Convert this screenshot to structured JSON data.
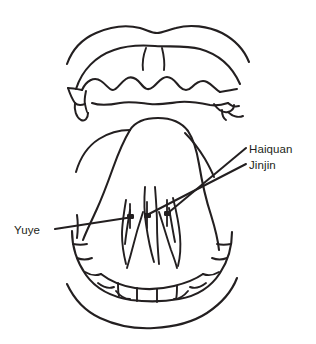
{
  "figure": {
    "background_color": "#ffffff",
    "ink_color": "#231f20",
    "width": 316,
    "height": 344
  },
  "labels": {
    "haiquan": "Haiquan",
    "jinjin": "Jinjin",
    "yuye": "Yuye"
  },
  "annotations": [
    {
      "name": "haiquan",
      "text": "Haiquan",
      "text_x": 249,
      "text_y": 142,
      "leader_from": [
        246,
        148
      ],
      "leader_to": [
        168,
        213
      ],
      "point": [
        168,
        213
      ]
    },
    {
      "name": "jinjin",
      "text": "Jinjin",
      "text_x": 249,
      "text_y": 158,
      "leader_from": [
        246,
        164
      ],
      "leader_to": [
        147,
        215
      ],
      "point": [
        147,
        215
      ]
    },
    {
      "name": "yuye",
      "text": "Yuye",
      "text_x": 14,
      "text_y": 223,
      "leader_from": [
        55,
        229
      ],
      "leader_to": [
        130,
        217
      ],
      "point": [
        130,
        217
      ]
    }
  ],
  "anatomy": {
    "parts": [
      "upper-lip-outer",
      "upper-lip-inner",
      "upper-labial-frenulum",
      "upper-teeth-arch",
      "left-upper-molars",
      "right-upper-molars",
      "tongue-underside",
      "floor-of-mouth-left",
      "floor-of-mouth-right",
      "sublingual-veins",
      "lower-teeth-arch",
      "lower-lip-outer"
    ],
    "point_markers": 3
  },
  "stroke": {
    "main_width": 2.0,
    "thin_width": 1.6,
    "leader_width": 2.0
  }
}
